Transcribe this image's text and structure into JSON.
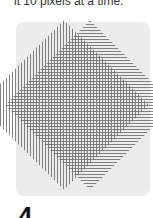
{
  "caption": {
    "text": "it 10 pixels at a time."
  },
  "figure": {
    "panel_color": "#ececec",
    "stripe_color": "#6d6d6d"
  },
  "step": {
    "number": "4"
  }
}
